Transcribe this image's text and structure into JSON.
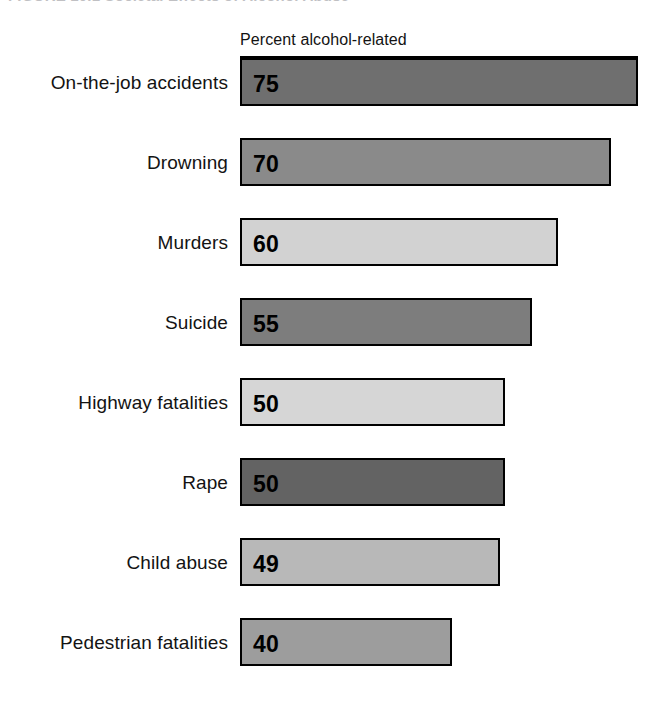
{
  "figure": {
    "caption_number": "FIGURE 10.1",
    "caption_text": "Societal Effects of Alcohol Abuse",
    "caption_full": "FIGURE 10.1   Societal Effects of Alcohol Abuse"
  },
  "column_header": "Percent alcohol-related",
  "chart_data": {
    "type": "bar",
    "orientation": "horizontal",
    "title": "Societal Effects of Alcohol Abuse",
    "xlabel": "Percent alcohol-related",
    "ylabel": "",
    "xlim": [
      0,
      80
    ],
    "grid": false,
    "legend": "none",
    "value_labels_inside_bars": true,
    "categories": [
      "On-the-job accidents",
      "Drowning",
      "Murders",
      "Suicide",
      "Highway fatalities",
      "Rape",
      "Child abuse",
      "Pedestrian fatalities"
    ],
    "values": [
      75,
      70,
      60,
      55,
      50,
      50,
      49,
      40
    ],
    "bar_colors": [
      "#6f6f6f",
      "#8a8a8a",
      "#d2d2d2",
      "#7d7d7d",
      "#d6d6d6",
      "#636363",
      "#b8b8b8",
      "#9d9d9d"
    ],
    "bar_border_color": "#000000",
    "bars": [
      {
        "label": "On-the-job accidents",
        "value": 75,
        "value_text": "75",
        "color": "#6f6f6f"
      },
      {
        "label": "Drowning",
        "value": 70,
        "value_text": "70",
        "color": "#8a8a8a"
      },
      {
        "label": "Murders",
        "value": 60,
        "value_text": "60",
        "color": "#d2d2d2"
      },
      {
        "label": "Suicide",
        "value": 55,
        "value_text": "55",
        "color": "#7d7d7d"
      },
      {
        "label": "Highway fatalities",
        "value": 50,
        "value_text": "50",
        "color": "#d6d6d6"
      },
      {
        "label": "Rape",
        "value": 50,
        "value_text": "50",
        "color": "#636363"
      },
      {
        "label": "Child abuse",
        "value": 49,
        "value_text": "49",
        "color": "#b8b8b8"
      },
      {
        "label": "Pedestrian fatalities",
        "value": 40,
        "value_text": "40",
        "color": "#9d9d9d"
      }
    ]
  },
  "layout": {
    "bar_origin_x": 240,
    "first_row_y": 58,
    "row_pitch": 80,
    "px_per_unit": 5.3,
    "background": "#ffffff"
  }
}
